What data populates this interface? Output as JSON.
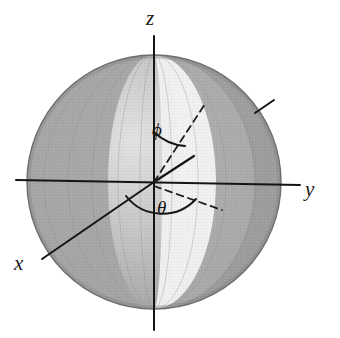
{
  "figure": {
    "background_color": "#ffffff"
  },
  "axes": [
    {
      "id": "x",
      "label": "x",
      "label_text": "x",
      "direction": "lower-left",
      "style": "solid"
    },
    {
      "id": "y",
      "label": "y",
      "label_text": "y",
      "direction": "right",
      "style": "solid"
    },
    {
      "id": "z",
      "label": "z",
      "label_text": "z",
      "direction": "up",
      "style": "solid"
    }
  ],
  "angles": [
    {
      "id": "phi",
      "label_text": "ϕ",
      "name": "polar-angle",
      "measured_from": "z-axis",
      "arc": "between z-axis and radius vector"
    },
    {
      "id": "theta",
      "label_text": "θ",
      "name": "azimuthal-angle",
      "measured_from": "x-axis",
      "arc": "in the xy-plane toward the projection of the radius vector"
    }
  ],
  "sphere": {
    "center_x": 154,
    "center_y": 182,
    "radius": 127,
    "shading_bands": [
      {
        "name": "far-left-rim",
        "color": "#a9a9a9"
      },
      {
        "name": "left-lune-light",
        "color": "#cfcfcf"
      },
      {
        "name": "left-mid",
        "color": "#b4b4b4"
      },
      {
        "name": "front-highlight",
        "color": "#efefef"
      },
      {
        "name": "bright-lune",
        "color": "#f2f2f2"
      },
      {
        "name": "right-mid",
        "color": "#a6a6a6"
      },
      {
        "name": "right-dark",
        "color": "#9a9a9a"
      },
      {
        "name": "right-rim",
        "color": "#8f8f8f"
      }
    ],
    "outline_color": "#6e6e6e"
  },
  "lines": [
    {
      "name": "radius-vector",
      "style": "solid",
      "from": "origin",
      "to": "surface point (upper right)"
    },
    {
      "name": "phi-ray-dashed",
      "style": "dashed",
      "from": "origin",
      "to": "sphere surface upper right"
    },
    {
      "name": "xy-projection-dashed",
      "style": "dashed",
      "from": "origin",
      "to": "lower right in xy-plane"
    },
    {
      "name": "equator-tick",
      "style": "solid",
      "from": "sphere surface",
      "to": "outside upper-right rim"
    }
  ],
  "colors": {
    "stroke": "#141414",
    "text": "#1a1a1a",
    "dash": "#222222",
    "background": "#ffffff"
  }
}
